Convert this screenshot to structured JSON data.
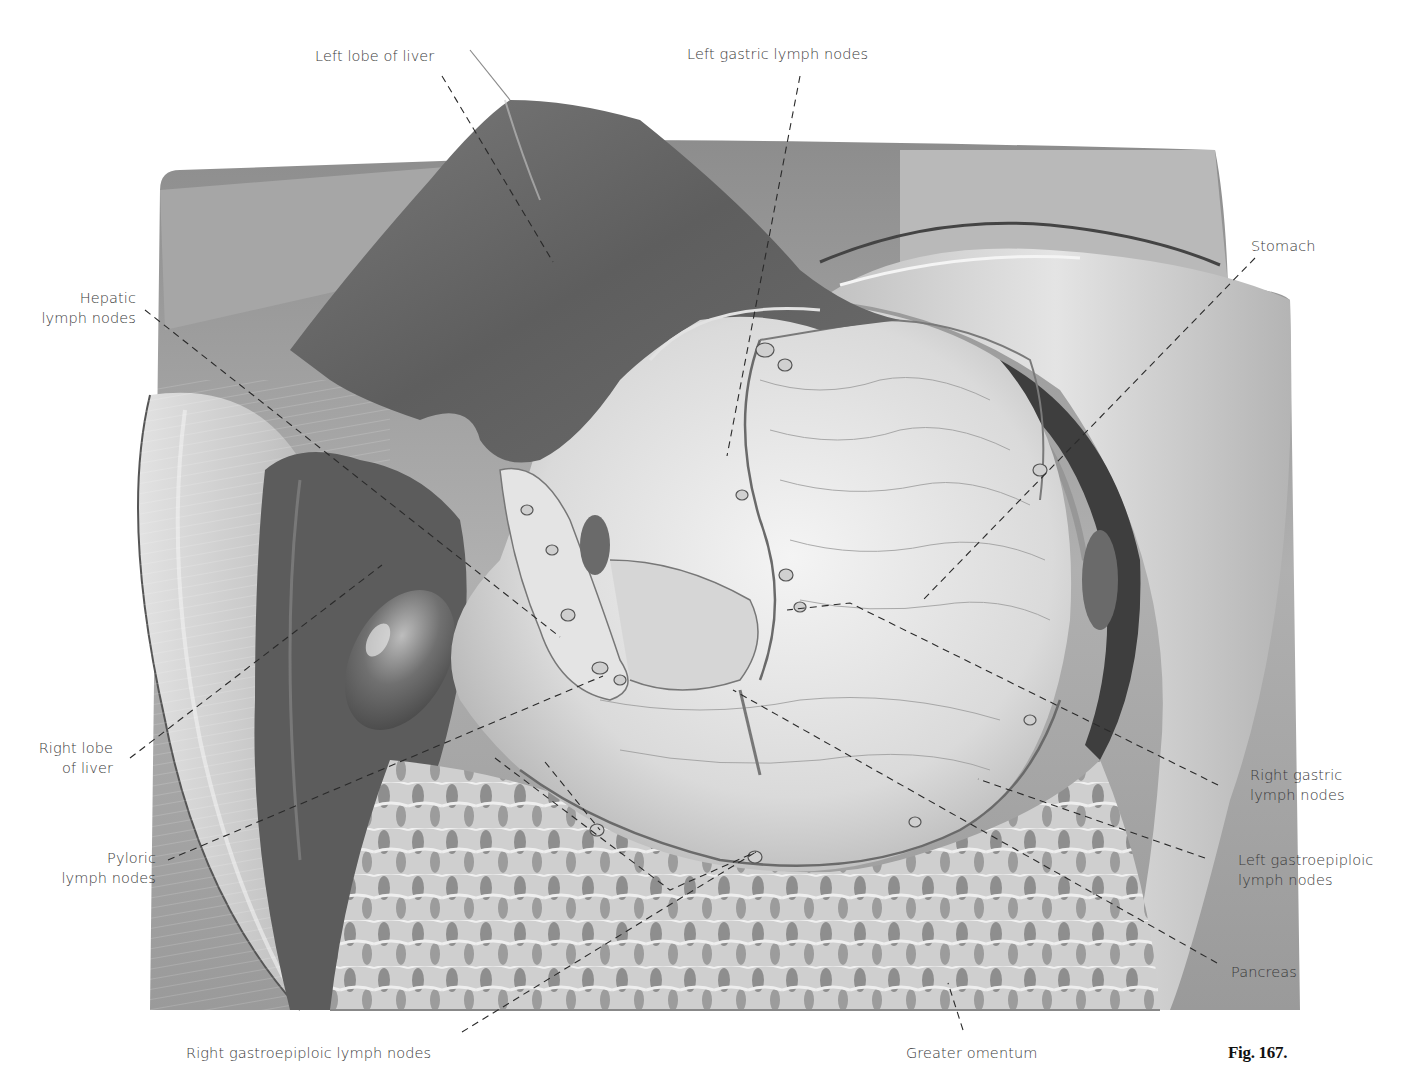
{
  "figure": {
    "caption": "Fig. 167.",
    "colors": {
      "background": "#ffffff",
      "liver": "#6e6e6e",
      "wall": "#9a9a9a",
      "stomach": "#dcdcdc",
      "omentum": "#bdbdbd",
      "text": "#3a3a3a",
      "leader": "#2a2a2a"
    }
  },
  "labels": {
    "left_lobe_of_liver": "Left lobe of liver",
    "left_gastric_lymph_nodes": "Left gastric lymph nodes",
    "stomach": "Stomach",
    "hepatic_lymph_nodes": {
      "line1": "Hepatic",
      "line2": "lymph nodes"
    },
    "right_lobe_of_liver": {
      "line1": "Right lobe",
      "line2": "of liver"
    },
    "pyloric_lymph_nodes": {
      "line1": "Pyloric",
      "line2": "lymph nodes"
    },
    "right_gastric_lymph_nodes": {
      "line1": "Right gastric",
      "line2": "lymph nodes"
    },
    "left_gastroepiploic_lymph_nodes": {
      "line1": "Left gastroepiploic",
      "line2": "lymph nodes"
    },
    "pancreas": "Pancreas",
    "right_gastroepiploic_lymph_nodes": "Right gastroepiploic lymph nodes",
    "greater_omentum": "Greater omentum"
  }
}
